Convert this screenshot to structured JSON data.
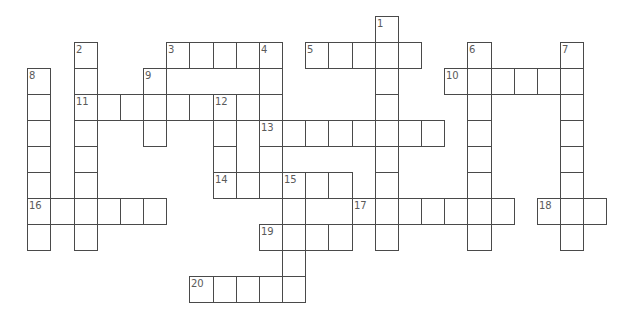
{
  "puzzle": {
    "grid": {
      "origin_x": 27.3,
      "origin_y": 15.7,
      "cell_width": 23.16,
      "cell_height": 26,
      "line_color": "#4a4a4a",
      "number_color": "#5a5a5a",
      "background": "#ffffff"
    },
    "entries": [
      {
        "number": 1,
        "direction": "down",
        "col": 15,
        "row": 0,
        "length": 9
      },
      {
        "number": 2,
        "direction": "down",
        "col": 2,
        "row": 1,
        "length": 8
      },
      {
        "number": 3,
        "direction": "across",
        "col": 6,
        "row": 1,
        "length": 5
      },
      {
        "number": 4,
        "direction": "down",
        "col": 10,
        "row": 1,
        "length": 6
      },
      {
        "number": 5,
        "direction": "across",
        "col": 12,
        "row": 1,
        "length": 5
      },
      {
        "number": 6,
        "direction": "down",
        "col": 19,
        "row": 1,
        "length": 8
      },
      {
        "number": 7,
        "direction": "down",
        "col": 23,
        "row": 1,
        "length": 8
      },
      {
        "number": 8,
        "direction": "down",
        "col": 0,
        "row": 2,
        "length": 7
      },
      {
        "number": 9,
        "direction": "down",
        "col": 5,
        "row": 2,
        "length": 3
      },
      {
        "number": 10,
        "direction": "across",
        "col": 18,
        "row": 2,
        "length": 6
      },
      {
        "number": 11,
        "direction": "across",
        "col": 2,
        "row": 3,
        "length": 8
      },
      {
        "number": 12,
        "direction": "down",
        "col": 8,
        "row": 3,
        "length": 4
      },
      {
        "number": 13,
        "direction": "across",
        "col": 10,
        "row": 4,
        "length": 8
      },
      {
        "number": 14,
        "direction": "across",
        "col": 8,
        "row": 6,
        "length": 6
      },
      {
        "number": 15,
        "direction": "down",
        "col": 11,
        "row": 6,
        "length": 5
      },
      {
        "number": 16,
        "direction": "across",
        "col": 0,
        "row": 7,
        "length": 6
      },
      {
        "number": 17,
        "direction": "across",
        "col": 14,
        "row": 7,
        "length": 7
      },
      {
        "number": 18,
        "direction": "across",
        "col": 22,
        "row": 7,
        "length": 3
      },
      {
        "number": 19,
        "direction": "across",
        "col": 10,
        "row": 8,
        "length": 4
      },
      {
        "number": 20,
        "direction": "across",
        "col": 7,
        "row": 10,
        "length": 5
      }
    ]
  }
}
